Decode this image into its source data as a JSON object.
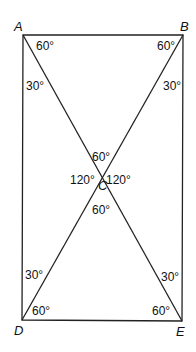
{
  "diagram": {
    "type": "rectangle-with-diagonals",
    "vertices": {
      "A": {
        "label": "A",
        "x": 23,
        "y": 35
      },
      "B": {
        "label": "B",
        "x": 183,
        "y": 35
      },
      "D": {
        "label": "D",
        "x": 22,
        "y": 320
      },
      "E": {
        "label": "E",
        "x": 182,
        "y": 321
      },
      "C": {
        "label": "C",
        "x": 102,
        "y": 178
      }
    },
    "angles": {
      "A_top": "60°",
      "A_side": "30°",
      "B_top": "60°",
      "B_side": "30°",
      "C_top": "60°",
      "C_left": "120°",
      "C_right": "120°",
      "C_bottom": "60°",
      "D_side": "30°",
      "D_bottom": "60°",
      "E_side": "30°",
      "E_bottom": "60°"
    }
  }
}
